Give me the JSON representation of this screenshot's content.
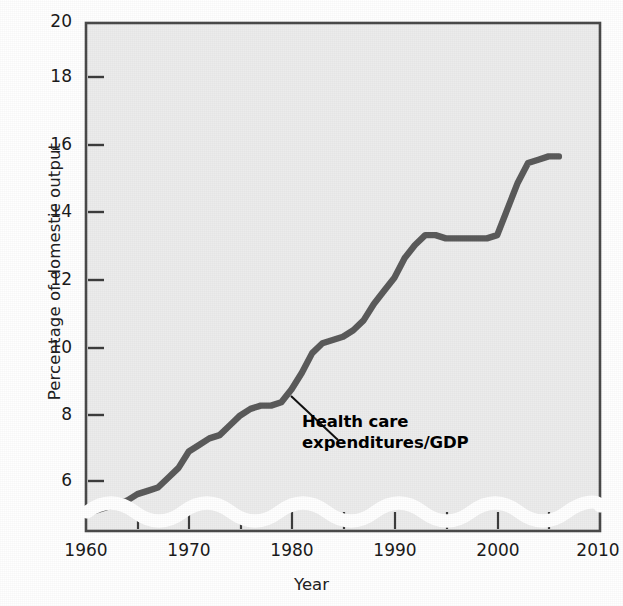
{
  "chart_data": {
    "type": "line",
    "title": "",
    "xlabel": "Year",
    "ylabel": "Percentage of domestic output",
    "xlim": [
      1960,
      2010
    ],
    "ylim": [
      4.6,
      20
    ],
    "y_axis_break": true,
    "y_break_note": "wavy white band below 6 indicating a broken / non-zero axis",
    "grid": false,
    "legend_position": "none",
    "xticks": [
      1960,
      1970,
      1980,
      1990,
      2000,
      2010
    ],
    "xtick_labels": [
      "1960",
      "1970",
      "1980",
      "1990",
      "2000",
      "2010"
    ],
    "x_minor_tick_interval": 5,
    "yticks": [
      6,
      8,
      10,
      12,
      14,
      16,
      18,
      20
    ],
    "ytick_labels": [
      "6",
      "8",
      "10",
      "12",
      "14",
      "16",
      "18",
      "20"
    ],
    "line_color": "#5b5b5b",
    "plot_background": "#ececec",
    "series": [
      {
        "name": "Health care expenditures/GDP",
        "x": [
          1960,
          1961,
          1962,
          1963,
          1964,
          1965,
          1966,
          1967,
          1968,
          1969,
          1970,
          1971,
          1972,
          1973,
          1974,
          1975,
          1976,
          1977,
          1978,
          1979,
          1980,
          1981,
          1982,
          1983,
          1984,
          1985,
          1986,
          1987,
          1988,
          1989,
          1990,
          1991,
          1992,
          1993,
          1994,
          1995,
          1996,
          1997,
          1998,
          1999,
          2000,
          2001,
          2002,
          2003,
          2004,
          2005,
          2006
        ],
        "values": [
          5.0,
          5.1,
          5.2,
          5.3,
          5.4,
          5.6,
          5.7,
          5.8,
          6.1,
          6.4,
          6.9,
          7.1,
          7.3,
          7.4,
          7.7,
          8.0,
          8.2,
          8.3,
          8.3,
          8.4,
          8.8,
          9.3,
          9.9,
          10.2,
          10.3,
          10.4,
          10.6,
          10.9,
          11.4,
          11.8,
          12.2,
          12.8,
          13.2,
          13.5,
          13.5,
          13.4,
          13.4,
          13.4,
          13.4,
          13.4,
          13.5,
          14.3,
          15.1,
          15.7,
          15.8,
          15.9,
          15.9
        ],
        "units": "percent of GDP"
      }
    ],
    "annotations": [
      {
        "text_lines": [
          "Health care",
          "expenditures/GDP"
        ],
        "points_to": {
          "x": 1980,
          "y": 8.8
        },
        "style": "bold with leader line"
      }
    ]
  },
  "axis": {
    "y_title": "Percentage of domestic output",
    "x_title": "Year"
  }
}
